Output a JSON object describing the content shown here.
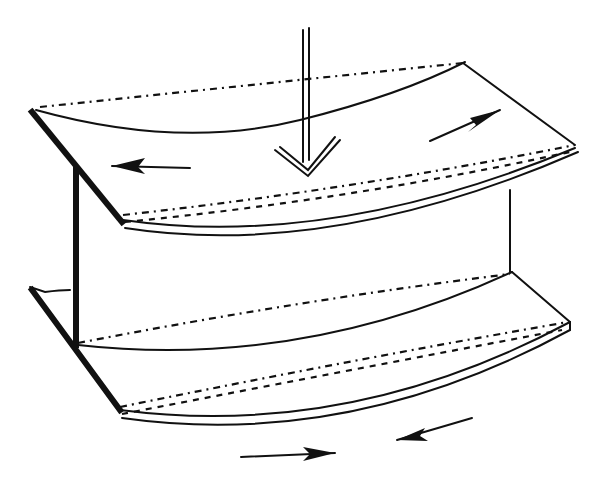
{
  "diagram": {
    "elements": {
      "load_arrow": {
        "direction": "down",
        "style": "double-line"
      },
      "top_flange": {
        "curvature": "sagging",
        "arrows": [
          {
            "position": "left",
            "direction": "left"
          },
          {
            "position": "right",
            "direction": "right"
          }
        ]
      },
      "web": {
        "style": "thick-edge"
      },
      "bottom_flange": {
        "curvature": "sagging",
        "arrows": [
          {
            "position": "bottom-center",
            "direction": "right"
          },
          {
            "position": "bottom-right",
            "direction": "left"
          }
        ]
      }
    },
    "colors": {
      "line": "#111111",
      "background": "#ffffff"
    }
  }
}
